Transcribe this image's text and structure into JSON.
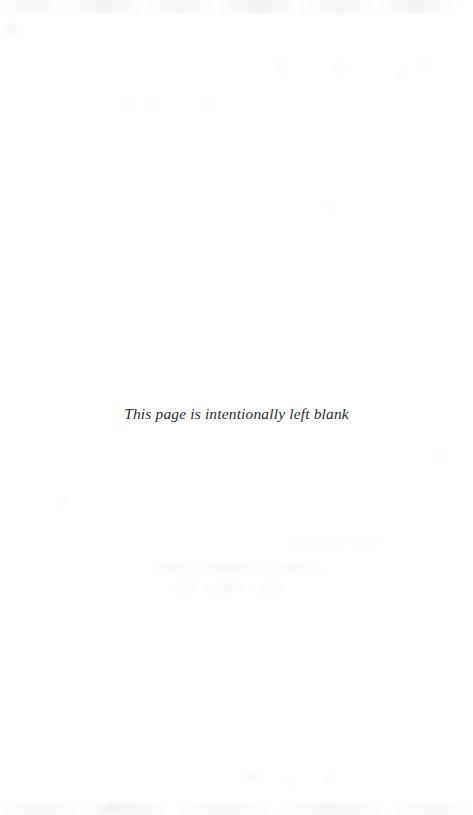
{
  "page": {
    "width": 473,
    "height": 815,
    "background_color": "#ffffff",
    "kind": "scanned-book-page"
  },
  "content": {
    "notice_text": "This page is intentionally left blank",
    "notice_color": "#2b2b2b",
    "notice_style": "italic-serif",
    "notice_alignment": "center"
  },
  "artifacts": {
    "description": "faint scanner noise and reverse-side show-through",
    "color": "#9aa0a6",
    "top_band": true,
    "bottom_band": true,
    "mid_ghost_line": true
  }
}
